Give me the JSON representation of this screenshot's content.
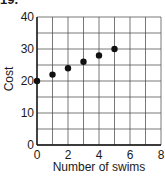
{
  "problem_number": "19.",
  "chart_data": {
    "type": "scatter",
    "title": "",
    "xlabel": "Number of swims",
    "ylabel": "Cost",
    "xlim": [
      0,
      8
    ],
    "ylim": [
      0,
      40
    ],
    "x_ticks": [
      0,
      2,
      4,
      6,
      8
    ],
    "y_ticks": [
      0,
      10,
      20,
      30,
      40
    ],
    "grid": true,
    "grid_x_step": 1,
    "grid_y_step": 5,
    "series": [
      {
        "name": "Cost",
        "x": [
          0,
          1,
          2,
          3,
          4,
          5
        ],
        "y": [
          20,
          22,
          24,
          26,
          28,
          30
        ]
      }
    ],
    "colors": {
      "point": "#111111",
      "grid": "#555555",
      "axis": "#111111"
    }
  }
}
